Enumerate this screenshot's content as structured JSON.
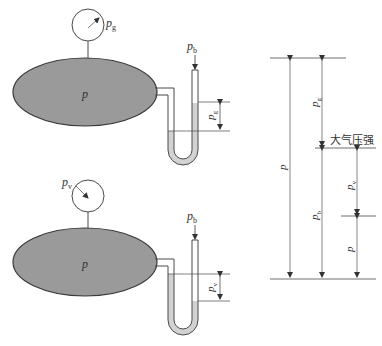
{
  "figure": {
    "colors": {
      "vessel_fill": "#9a9a9a",
      "liquid_fill": "#d2d2d2",
      "line": "#4a4a4a",
      "background": "#ffffff"
    },
    "top_panel": {
      "gauge_label": "p",
      "gauge_sub": "g",
      "vessel_label": "p",
      "atm_label": "p",
      "atm_sub": "b",
      "dim_label": "p",
      "dim_sub": "g"
    },
    "bottom_panel": {
      "gauge_label": "p",
      "gauge_sub": "v",
      "vessel_label": "p",
      "atm_label": "p",
      "atm_sub": "b",
      "dim_label": "p",
      "dim_sub": "v"
    },
    "right_panel": {
      "atmospheric_pressure_label": "大气压强",
      "p_label": "p",
      "pg_label": "p",
      "pg_sub": "g",
      "pb_label": "p",
      "pb_sub": "b",
      "pv_label": "p",
      "pv_sub": "v",
      "p_low_label": "p"
    }
  }
}
